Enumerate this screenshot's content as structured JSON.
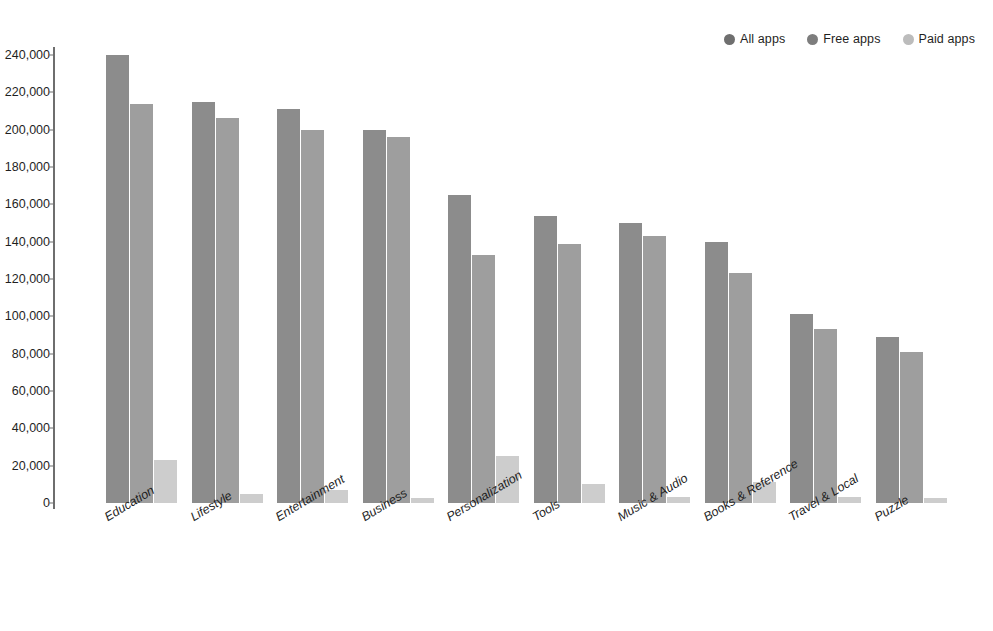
{
  "chart_data": {
    "type": "bar",
    "title": "",
    "xlabel": "",
    "ylabel": "",
    "ylim": [
      0,
      240000
    ],
    "grid": false,
    "legend_position": "top-right",
    "categories": [
      "Education",
      "Lifestyle",
      "Entertainment",
      "Business",
      "Personalization",
      "Tools",
      "Music & Audio",
      "Books & Reference",
      "Travel & Local",
      "Puzzle"
    ],
    "y_ticks": [
      "0",
      "20,000",
      "40,000",
      "60,000",
      "80,000",
      "100,000",
      "120,000",
      "140,000",
      "160,000",
      "180,000",
      "200,000",
      "220,000",
      "240,000"
    ],
    "y_tick_values": [
      0,
      20000,
      40000,
      60000,
      80000,
      100000,
      120000,
      140000,
      160000,
      180000,
      200000,
      220000,
      240000
    ],
    "series": [
      {
        "name": "All apps",
        "color": "#8c8c8c",
        "values": [
          240000,
          215000,
          211000,
          200000,
          165000,
          154000,
          150000,
          140000,
          101000,
          89000
        ]
      },
      {
        "name": "Free apps",
        "color": "#9e9e9e",
        "values": [
          214000,
          206000,
          200000,
          196000,
          133000,
          139000,
          143000,
          123000,
          93000,
          81000
        ]
      },
      {
        "name": "Paid apps",
        "color": "#cdcdcd",
        "values": [
          23000,
          5000,
          7000,
          2500,
          25000,
          10000,
          3000,
          11000,
          3000,
          2500
        ]
      }
    ]
  },
  "legend": {
    "items": [
      {
        "label": "All apps",
        "color": "#6f6f6f"
      },
      {
        "label": "Free apps",
        "color": "#7d7d7d"
      },
      {
        "label": "Paid apps",
        "color": "#bcbcbc"
      }
    ]
  },
  "axis": {
    "line_color": "#6e6e6e"
  }
}
